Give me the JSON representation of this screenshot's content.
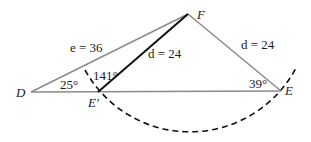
{
  "diagram": {
    "type": "triangle-ambiguous-case",
    "points": {
      "D": {
        "label": "D",
        "x": 31,
        "y": 92
      },
      "E_prime": {
        "label": "E′",
        "x": 98,
        "y": 92
      },
      "F": {
        "label": "F",
        "x": 188,
        "y": 14
      },
      "E": {
        "label": "E",
        "x": 281,
        "y": 91
      }
    },
    "sides": {
      "DF": {
        "label": "e = 36"
      },
      "E_prime_F": {
        "label": "d = 24"
      },
      "FE": {
        "label": "d = 24"
      }
    },
    "angles": {
      "D": {
        "label": "25°"
      },
      "E_prime": {
        "label": "141°"
      },
      "E": {
        "label": "39°"
      }
    },
    "arc": {
      "center": "F",
      "radius": 120,
      "style": "dashed"
    },
    "colors": {
      "line": "#8a8a8a",
      "bold_line": "#111111",
      "arc": "#111111",
      "text": "#222222"
    }
  }
}
